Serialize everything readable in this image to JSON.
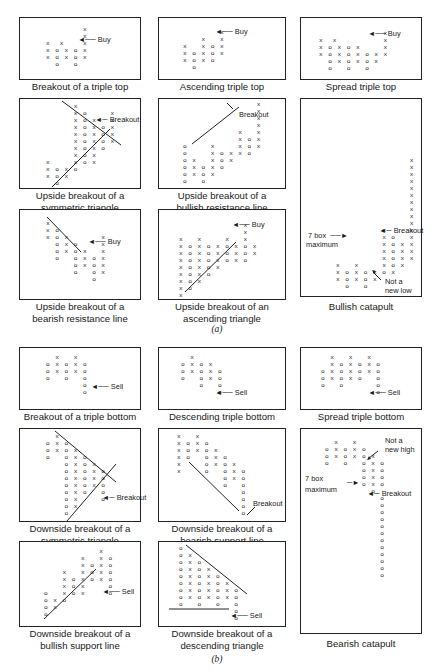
{
  "figure": {
    "section_a_label": "(a)",
    "section_b_label": "(b)",
    "annotations": {
      "buy": "Buy",
      "sell": "Sell",
      "breakout": "Breakout",
      "seven_box": "7 box",
      "maximum": "maximum",
      "not_a": "Not a",
      "new_low": "new low",
      "new_high": "new high"
    },
    "panels_a": [
      {
        "id": "breakout-triple-top",
        "caption": [
          "Breakout of a triple top"
        ],
        "grid": "        x\n        x\nx  x    x\nx o x o x\nx o x o x\n  o   o"
      },
      {
        "id": "ascending-triple-top",
        "caption": [
          "Ascending triple top"
        ],
        "grid": "        x\n    x   x\nx   x o x\nx o x o x\nx o x o\n  o"
      },
      {
        "id": "spread-triple-top",
        "caption": [
          "Spread triple top"
        ],
        "grid": "              x\nx  x          x\nx o x o x     x\nx o x o x o x x\n  o x o x o x\n  o   o   o"
      },
      {
        "id": "upside-breakout-symmetric-triangle",
        "caption": [
          "Upside breakout of a",
          "symmetric triangle"
        ],
        "grid": "      x\n      x o     x\n      x o x   x\n      x o x o x\n      x o x o x\n      x o x o x\n      x o x o\n      x o x\nx     x o x\nx o x o\nx o x\n  o"
      },
      {
        "id": "upside-breakout-bullish-resistance",
        "caption": [
          "Upside breakout of a",
          "bullish resistance line"
        ],
        "grid": "                x\n                x\n                x\n                x\n            x   x\n            x o x\no     x     x o x\no     x o x x o\no x   x o x\no x o x o\no x o x\no   o"
      },
      {
        "id": "upside-breakout-bearish-resistance",
        "caption": [
          "Upside breakout of a",
          "bearish resistance line"
        ],
        "grid": "x\nx o\nx o x       x\n  o x o     x\n  o x o x   x\n  o   o x o x\n      o x o x\n      o   o x\n          o"
      },
      {
        "id": "upside-breakout-ascending-triangle",
        "caption": [
          "Upside breakout of an",
          "ascending triangle"
        ],
        "grid": "              x\n              x\nx   x     x   x\nx o x o x o x o x\nx o x o x o x o x\nx o x o x o x o\nx o x o x\nx o x o\nx o x\nx o\nx"
      },
      {
        "id": "bullish-catapult",
        "caption": [
          "Bullish catapult"
        ],
        "grid": ""
      }
    ],
    "panels_b": [
      {
        "id": "breakout-triple-bottom",
        "caption": [
          "Breakout of a triple bottom"
        ],
        "grid": "  x   x\no x o x o\no x o x o\no   o   o\n        o\n        o"
      },
      {
        "id": "descending-triple-bottom",
        "caption": [
          "Descending triple bottom"
        ],
        "grid": "  x\no x o x\no x o x o\no   o x o\n    o   o\n        o"
      },
      {
        "id": "spread-triple-bottom",
        "caption": [
          "Spread triple bottom"
        ],
        "grid": "  x   x   x\n  x o x o x o\no x o x o x o\no x o x o   o\no   o       o\n            o"
      },
      {
        "id": "downside-breakout-symmetric-triangle",
        "caption": [
          "Downside breakout of a",
          "symmetric triangle"
        ],
        "grid": "  x\no x o\no x o x\no   o x o\n    o x o x\n    o x o x o\n    o x o x o\n    o x o x o\n    o x o   o\n    o x     o\n    o x\n    o"
      },
      {
        "id": "downside-breakout-bearish-support",
        "caption": [
          "Downside breakout of a",
          "bearish support line"
        ],
        "grid": "x   x\nx o x o\nx o x o x\nx o   o x o\nx     o x o x\nx     o   o x o\n          o x o\n          o   o\n              o\n              o\n              o\n              o"
      },
      {
        "id": "bearish-catapult",
        "caption": [
          "Bearish catapult"
        ],
        "grid": ""
      },
      {
        "id": "downside-breakout-bullish-support",
        "caption": [
          "Downside breakout of a",
          "bullish support line"
        ],
        "grid": "            x\n        x   x o\n        x o x o\n    x   x o x o\n    x o x o x o\n    x o x     o\no   x o x     o\no x o\no x\no"
      },
      {
        "id": "downside-breakout-descending-triangle",
        "caption": [
          "Downside breakout of a",
          "descending triangle"
        ],
        "grid": "o\no x\no x o\no x o x\no x o x o\no x o x o x\no x o x o x o\no x o x o x o\no   o   o   o\n            o\n            o"
      }
    ],
    "bullish_catapult_grid": "                x\n                x\n                x\n                x\n                x\n                x\n                x\n                x\n                x\n                x\n          x     x\n          x o   x\n          x o x x\n          x o x x\n          x o x x\nx   x     x o x\nx o x o x o x\nx o x o x\n  o   o",
    "bearish_catapult_grid": "  x   x\no x o x o\no x o x o x\no   o   o x o\n        o x o\n        o x o\n        o x o\n          o\n            o\n            o\n            o\n            o\n            o\n            o\n            o\n            o\n            o\n            o\n            o\n            o"
  }
}
